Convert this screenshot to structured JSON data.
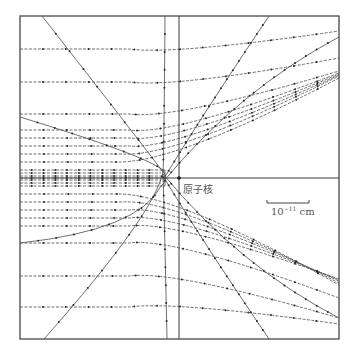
{
  "diagram": {
    "title": "",
    "nucleus_label": "原子核",
    "scale_bar": {
      "base": "10",
      "exponent": "−11",
      "unit": "cm"
    },
    "colors": {
      "line": "#4a4a4a",
      "frame": "#3a3a3a",
      "text": "#555555",
      "background": "#ffffff"
    },
    "frame": {
      "x0": 20,
      "y0": 16,
      "x1": 339,
      "y1": 339
    },
    "nucleus": {
      "x": 179,
      "y": 178
    },
    "trajectories_upper": [
      {
        "impact_y": 49,
        "exit_y": 31
      },
      {
        "impact_y": 82,
        "exit_y": 58
      },
      {
        "impact_y": 114,
        "exit_y": 71
      },
      {
        "impact_y": 130,
        "exit_y": 73
      },
      {
        "impact_y": 138,
        "exit_y": 74
      },
      {
        "impact_y": 146,
        "exit_y": 75
      },
      {
        "impact_y": 154,
        "exit_y": 76
      },
      {
        "impact_y": 162,
        "exit_y": 78
      }
    ],
    "trajectories_lower": [
      {
        "impact_y": 194,
        "exit_y": 285
      },
      {
        "impact_y": 202,
        "exit_y": 283
      },
      {
        "impact_y": 210,
        "exit_y": 281
      },
      {
        "impact_y": 218,
        "exit_y": 280
      },
      {
        "impact_y": 226,
        "exit_y": 279
      },
      {
        "impact_y": 243,
        "exit_y": 298
      },
      {
        "impact_y": 276,
        "exit_y": 318
      },
      {
        "impact_y": 307,
        "exit_y": 324
      }
    ],
    "central_band": [
      170,
      173,
      176,
      178,
      180,
      183,
      186
    ]
  }
}
